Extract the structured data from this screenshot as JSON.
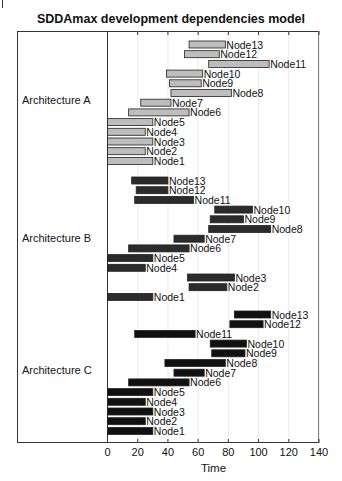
{
  "chart_data": {
    "type": "bar",
    "subtype": "gantt",
    "title": "SDDAmax development dependencies model",
    "xlabel": "Time",
    "ylabel": "",
    "xlim": [
      0,
      140
    ],
    "xticks": [
      0,
      20,
      40,
      60,
      80,
      100,
      120,
      140
    ],
    "grid": "vertical",
    "groups": [
      {
        "name": "Architecture A",
        "color": "#bdbdbd",
        "tasks": [
          {
            "label": "Node13",
            "start": 54,
            "end": 78
          },
          {
            "label": "Node12",
            "start": 51,
            "end": 74
          },
          {
            "label": "Node11",
            "start": 67,
            "end": 107
          },
          {
            "label": "Node10",
            "start": 39,
            "end": 63
          },
          {
            "label": "Node9",
            "start": 41,
            "end": 62
          },
          {
            "label": "Node8",
            "start": 42,
            "end": 82
          },
          {
            "label": "Node7",
            "start": 22,
            "end": 42
          },
          {
            "label": "Node6",
            "start": 14,
            "end": 54
          },
          {
            "label": "Node5",
            "start": 0,
            "end": 30
          },
          {
            "label": "Node4",
            "start": 0,
            "end": 25
          },
          {
            "label": "Node3",
            "start": 0,
            "end": 30
          },
          {
            "label": "Node2",
            "start": 0,
            "end": 25
          },
          {
            "label": "Node1",
            "start": 0,
            "end": 30
          }
        ]
      },
      {
        "name": "Architecture B",
        "color": "#2b2b2b",
        "tasks": [
          {
            "label": "Node13",
            "start": 16,
            "end": 40
          },
          {
            "label": "Node12",
            "start": 19,
            "end": 40
          },
          {
            "label": "Node11",
            "start": 18,
            "end": 57
          },
          {
            "label": "Node10",
            "start": 71,
            "end": 96
          },
          {
            "label": "Node9",
            "start": 68,
            "end": 90
          },
          {
            "label": "Node8",
            "start": 67,
            "end": 108
          },
          {
            "label": "Node7",
            "start": 44,
            "end": 64
          },
          {
            "label": "Node6",
            "start": 14,
            "end": 54
          },
          {
            "label": "Node5",
            "start": 0,
            "end": 30
          },
          {
            "label": "Node4",
            "start": 0,
            "end": 25
          },
          {
            "label": "Node3",
            "start": 53,
            "end": 84
          },
          {
            "label": "Node2",
            "start": 54,
            "end": 79
          },
          {
            "label": "Node1",
            "start": 0,
            "end": 30
          }
        ]
      },
      {
        "name": "Architecture C",
        "color": "#111111",
        "tasks": [
          {
            "label": "Node13",
            "start": 84,
            "end": 108
          },
          {
            "label": "Node12",
            "start": 81,
            "end": 103
          },
          {
            "label": "Node11",
            "start": 18,
            "end": 58
          },
          {
            "label": "Node10",
            "start": 68,
            "end": 92
          },
          {
            "label": "Node9",
            "start": 69,
            "end": 91
          },
          {
            "label": "Node8",
            "start": 38,
            "end": 78
          },
          {
            "label": "Node7",
            "start": 44,
            "end": 64
          },
          {
            "label": "Node6",
            "start": 14,
            "end": 54
          },
          {
            "label": "Node5",
            "start": 0,
            "end": 30
          },
          {
            "label": "Node4",
            "start": 0,
            "end": 25
          },
          {
            "label": "Node3",
            "start": 0,
            "end": 30
          },
          {
            "label": "Node2",
            "start": 0,
            "end": 25
          },
          {
            "label": "Node1",
            "start": 0,
            "end": 30
          }
        ]
      }
    ]
  }
}
